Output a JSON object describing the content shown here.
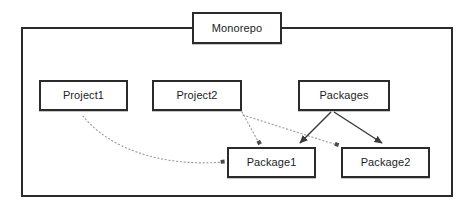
{
  "diagram": {
    "background_color": "#ffffff",
    "border_color": "#2b2b2b",
    "text_color": "#1d1d1d",
    "solid_edge_color": "#3a3a3a",
    "dotted_edge_color": "#9a9a9a",
    "container": {
      "label": "Monorepo"
    },
    "nodes": [
      {
        "id": "monorepo",
        "label": "Monorepo"
      },
      {
        "id": "project1",
        "label": "Project1"
      },
      {
        "id": "project2",
        "label": "Project2"
      },
      {
        "id": "packages",
        "label": "Packages"
      },
      {
        "id": "package1",
        "label": "Package1"
      },
      {
        "id": "package2",
        "label": "Package2"
      }
    ],
    "edges": [
      {
        "id": "e1",
        "from": "Project1",
        "to": "Package1",
        "style": "dotted",
        "shape": "curved"
      },
      {
        "id": "e2",
        "from": "Project2",
        "to": "Package1",
        "style": "dotted",
        "shape": "straight"
      },
      {
        "id": "e3",
        "from": "Project2",
        "to": "Package2",
        "style": "dotted",
        "shape": "straight"
      },
      {
        "id": "e4",
        "from": "Packages",
        "to": "Package1",
        "style": "solid",
        "shape": "straight"
      },
      {
        "id": "e5",
        "from": "Packages",
        "to": "Package2",
        "style": "solid",
        "shape": "straight"
      }
    ]
  }
}
